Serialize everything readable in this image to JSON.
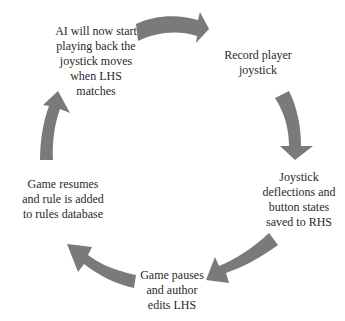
{
  "diagram": {
    "type": "cycle",
    "arrow_color": "#7a7a7a",
    "background": "#ffffff",
    "nodes": [
      {
        "id": "ai-playback",
        "lines": [
          "AI will now start",
          "playing back the",
          "joystick moves",
          "when LHS",
          "matches"
        ]
      },
      {
        "id": "record",
        "lines": [
          "Record player",
          "joystick"
        ]
      },
      {
        "id": "save-rhs",
        "lines": [
          "Joystick",
          "deflections and",
          "button states",
          "saved to RHS"
        ]
      },
      {
        "id": "pause-edit",
        "lines": [
          "Game pauses",
          "and author",
          "edits LHS"
        ]
      },
      {
        "id": "resume-add",
        "lines": [
          "Game resumes",
          "and rule is added",
          "to rules database"
        ]
      }
    ],
    "edges": [
      {
        "from": "ai-playback",
        "to": "record"
      },
      {
        "from": "record",
        "to": "save-rhs"
      },
      {
        "from": "save-rhs",
        "to": "pause-edit"
      },
      {
        "from": "pause-edit",
        "to": "resume-add"
      },
      {
        "from": "resume-add",
        "to": "ai-playback"
      }
    ]
  }
}
